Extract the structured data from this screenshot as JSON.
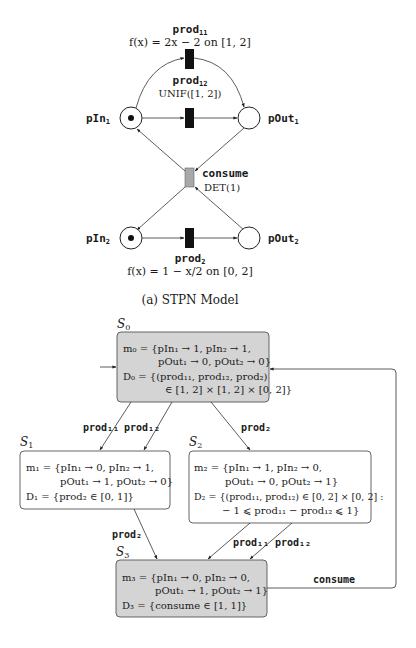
{
  "stpn": {
    "caption": "(a) STPN Model",
    "places": [
      {
        "id": "pIn1",
        "label": "pIn",
        "sub": "1",
        "token": true
      },
      {
        "id": "pOut1",
        "label": "pOut",
        "sub": "1",
        "token": false
      },
      {
        "id": "pIn2",
        "label": "pIn",
        "sub": "2",
        "token": true
      },
      {
        "id": "pOut2",
        "label": "pOut",
        "sub": "2",
        "token": false
      }
    ],
    "transitions": [
      {
        "id": "prod11",
        "name": "prod",
        "sub": "11",
        "dist": "f(x) = 2x − 2 on [1, 2]"
      },
      {
        "id": "prod12",
        "name": "prod",
        "sub": "12",
        "dist": "UNIF([1, 2])"
      },
      {
        "id": "consume",
        "name": "consume",
        "sub": "",
        "dist": "DET(1)"
      },
      {
        "id": "prod2",
        "name": "prod",
        "sub": "2",
        "dist": "f(x) = 1 − x/2 on [0, 2]"
      }
    ],
    "colors": {
      "immediate": "#111111",
      "deterministic": "#a8a8a8"
    }
  },
  "graph": {
    "states": [
      {
        "id": "S0",
        "label": "S",
        "sub": "0",
        "shaded": true,
        "m_lines": [
          "m₀ = {pIn₁ → 1, pIn₂ → 1,",
          "pOut₁ → 0, pOut₂ → 0}"
        ],
        "d_lines": [
          "D₀ = {(prod₁₁, prod₁₂, prod₂)",
          "∈ [1, 2] × [1, 2] × [0, 2]}"
        ]
      },
      {
        "id": "S1",
        "label": "S",
        "sub": "1",
        "shaded": false,
        "m_lines": [
          "m₁ = {pIn₁ → 0, pIn₂ → 1,",
          "pOut₁ → 1, pOut₂ → 0}"
        ],
        "d_lines": [
          "D₁ = {prod₂ ∈ [0, 1]}"
        ]
      },
      {
        "id": "S2",
        "label": "S",
        "sub": "2",
        "shaded": false,
        "m_lines": [
          "m₂ = {pIn₁ → 1, pIn₂ → 0,",
          "pOut₁ → 0, pOut₂ → 1}"
        ],
        "d_lines": [
          "D₂ = {(prod₁₁, prod₁₂) ∈ [0, 2] × [0, 2] :",
          "− 1 ⩽ prod₁₁ − prod₁₂ ⩽ 1}"
        ]
      },
      {
        "id": "S3",
        "label": "S",
        "sub": "3",
        "shaded": true,
        "m_lines": [
          "m₃ = {pIn₁ → 0, pIn₂ → 0,",
          "pOut₁ → 1, pOut₂ → 1}"
        ],
        "d_lines": [
          "D₃ = {consume ∈ [1, 1]}"
        ]
      }
    ],
    "edges": [
      {
        "from": "S0",
        "to": "S1",
        "label": "prod₁₁"
      },
      {
        "from": "S0",
        "to": "S1",
        "label": "prod₁₂"
      },
      {
        "from": "S0",
        "to": "S2",
        "label": "prod₂"
      },
      {
        "from": "S1",
        "to": "S3",
        "label": "prod₂"
      },
      {
        "from": "S2",
        "to": "S3",
        "label": "prod₁₁"
      },
      {
        "from": "S2",
        "to": "S3",
        "label": "prod₁₂"
      },
      {
        "from": "S3",
        "to": "S0",
        "label": "consume"
      }
    ],
    "colors": {
      "shaded": "#d4d4d4",
      "plain": "#ffffff",
      "border": "#555555"
    }
  }
}
